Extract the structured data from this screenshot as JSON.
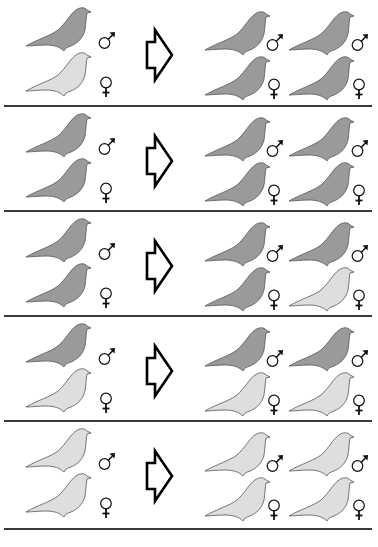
{
  "diagram": {
    "title": "",
    "colors": {
      "dark": "#9a9a9a",
      "light": "#dedede",
      "outline": "#555555",
      "separator": "#3a3a3a",
      "symbol": "#111111"
    },
    "labels": {
      "male": "♂",
      "female": "♀"
    },
    "rows": [
      {
        "parents": {
          "male": "dark",
          "female": "light"
        },
        "offspring": [
          {
            "sex": "male",
            "color": "dark"
          },
          {
            "sex": "male",
            "color": "dark"
          },
          {
            "sex": "female",
            "color": "dark"
          },
          {
            "sex": "female",
            "color": "dark"
          }
        ]
      },
      {
        "parents": {
          "male": "dark",
          "female": "dark"
        },
        "offspring": [
          {
            "sex": "male",
            "color": "dark"
          },
          {
            "sex": "male",
            "color": "dark"
          },
          {
            "sex": "female",
            "color": "dark"
          },
          {
            "sex": "female",
            "color": "dark"
          }
        ]
      },
      {
        "parents": {
          "male": "dark",
          "female": "dark"
        },
        "offspring": [
          {
            "sex": "male",
            "color": "dark"
          },
          {
            "sex": "male",
            "color": "dark"
          },
          {
            "sex": "female",
            "color": "dark"
          },
          {
            "sex": "female",
            "color": "light"
          }
        ]
      },
      {
        "parents": {
          "male": "dark",
          "female": "light"
        },
        "offspring": [
          {
            "sex": "male",
            "color": "dark"
          },
          {
            "sex": "male",
            "color": "dark"
          },
          {
            "sex": "female",
            "color": "light"
          },
          {
            "sex": "female",
            "color": "light"
          }
        ]
      },
      {
        "parents": {
          "male": "light",
          "female": "light"
        },
        "offspring": [
          {
            "sex": "male",
            "color": "light"
          },
          {
            "sex": "male",
            "color": "light"
          },
          {
            "sex": "female",
            "color": "light"
          },
          {
            "sex": "female",
            "color": "light"
          }
        ]
      }
    ]
  }
}
